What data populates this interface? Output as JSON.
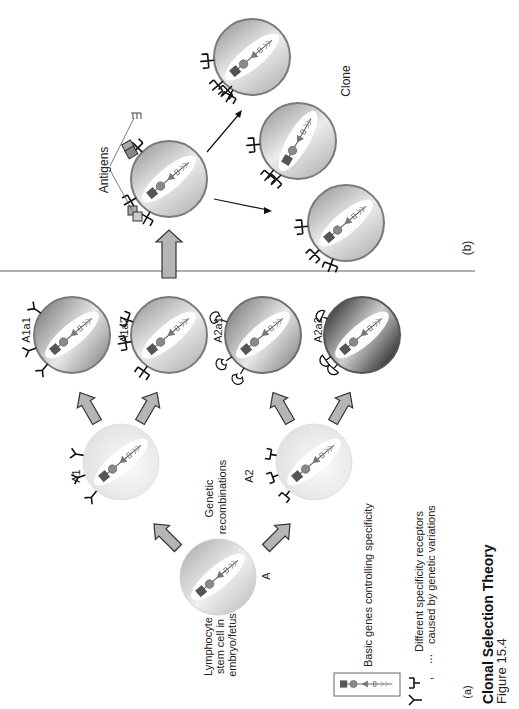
{
  "figure": {
    "title": "Clonal Selection Theory",
    "subtitle": "Figure 15.4",
    "panel_a_label": "(a)",
    "panel_b_label": "(b)"
  },
  "panel_a": {
    "stem_cell": {
      "id": "A",
      "label": "A",
      "caption_lines": [
        "Lymphocyte",
        "stem cell in",
        "embryo/fetus"
      ]
    },
    "process_label_lines": [
      "Genetic",
      "recombinations"
    ],
    "level1": [
      {
        "id": "A1",
        "label": "A1",
        "receptor": "y-shape"
      },
      {
        "id": "A2",
        "label": "A2",
        "receptor": "cup-shape"
      }
    ],
    "level2": [
      {
        "id": "A1a1",
        "label": "A1a1",
        "receptor": "y-shape"
      },
      {
        "id": "A1a2",
        "label": "A1a2",
        "receptor": "fork-shape"
      },
      {
        "id": "A2a1",
        "label": "A2a1",
        "receptor": "hook-shape"
      },
      {
        "id": "A2a2",
        "label": "A2a2",
        "receptor": "mushroom-shape"
      }
    ]
  },
  "panel_b": {
    "antigens_label": "Antigens",
    "clone_label": "Clone",
    "selected_cell": "A1a2",
    "clone_count": 3
  },
  "legend": {
    "genes_label": "Basic genes controlling specificity",
    "receptors_label_lines": [
      "Different specificity receptors",
      "caused by genetic variations"
    ],
    "receptors_prefix": ", ",
    "receptors_ellipsis": "..."
  },
  "colors": {
    "cell_light": "#ededed",
    "cell_mid": "#c8c8c8",
    "cell_dark": "#6e6e6e",
    "cell_border": "#7a7a7a",
    "arrow_fill": "#b5b5b5",
    "divider": "#b0b0b0",
    "gene_dark": "#555555",
    "gene_mid": "#8a8a8a"
  }
}
